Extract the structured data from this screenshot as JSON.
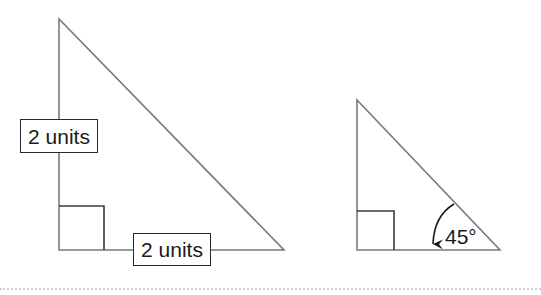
{
  "diagram": {
    "colors": {
      "triangle_stroke": "#7a7a7a",
      "label_border": "#2a2a2a",
      "text": "#1a1a1a",
      "divider": "#d0d0d0"
    },
    "left_triangle": {
      "vertices": {
        "top": [
          59,
          19
        ],
        "right_angle": [
          59,
          250
        ],
        "bottom_right": [
          284,
          250
        ]
      },
      "right_angle_marker": {
        "x": 59,
        "y": 206,
        "size": 45
      },
      "vertical_leg_label": "2 units",
      "horizontal_leg_label": "2 units"
    },
    "right_triangle": {
      "vertices": {
        "top": [
          357,
          100
        ],
        "right_angle": [
          357,
          250
        ],
        "bottom_right": [
          500,
          250
        ]
      },
      "right_angle_marker": {
        "x": 357,
        "y": 211,
        "size": 38
      },
      "angle_label": "45°",
      "angle_arrow": "arc-arrow-from-hypotenuse-to-base"
    }
  }
}
